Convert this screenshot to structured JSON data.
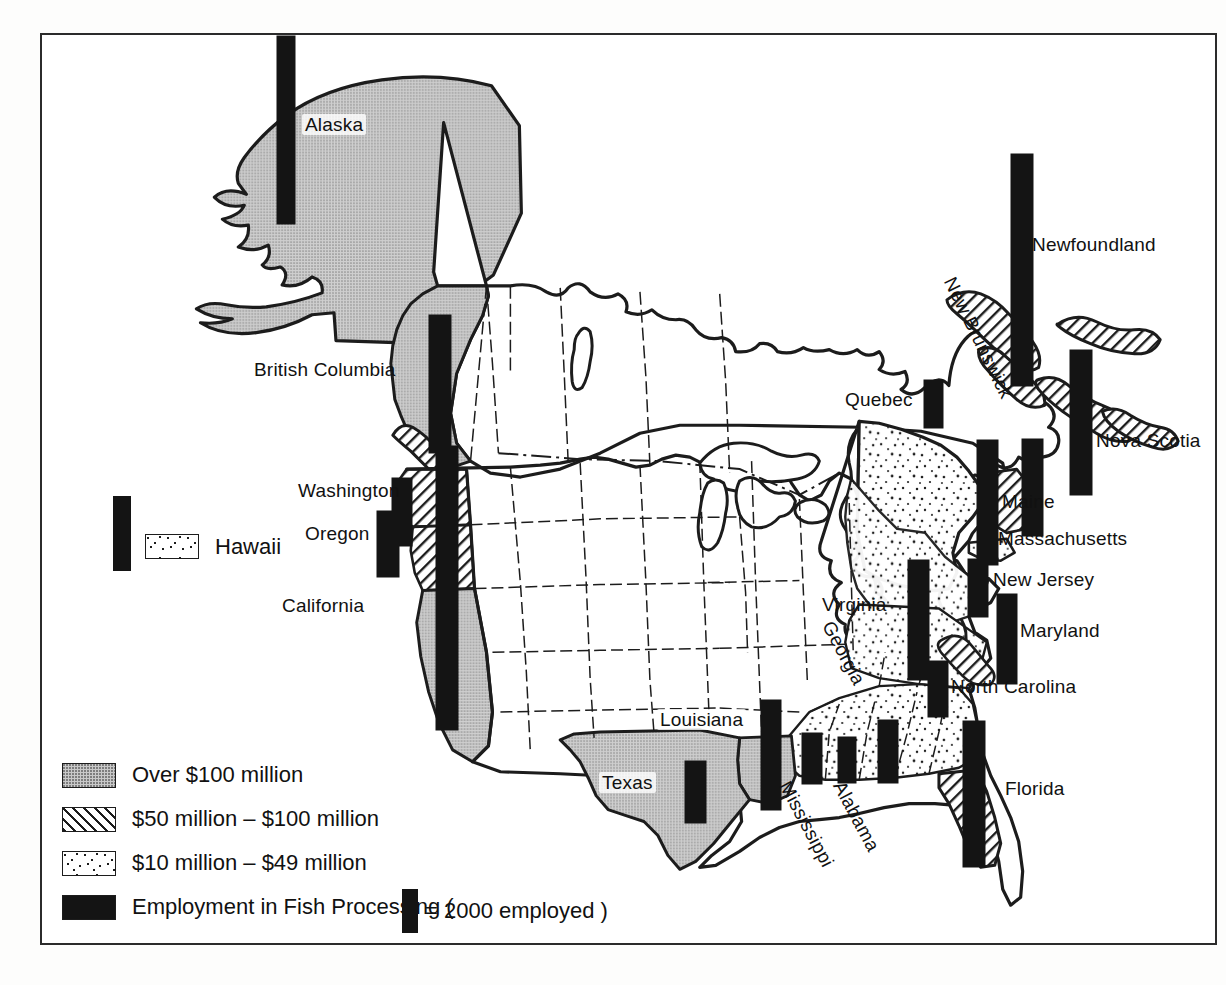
{
  "map": {
    "title": "Employment in Fish Processing — North America",
    "colors": {
      "ink": "#141414",
      "outline": "#1c1c1c",
      "over100_fill": "#c9c9c9",
      "paper": "#ffffff"
    },
    "region_labels": [
      {
        "name": "Alaska",
        "text": "Alaska",
        "x": 300,
        "y": 112,
        "rotate": 0,
        "boxed": true
      },
      {
        "name": "British Columbia",
        "text": "British Columbia",
        "x": 252,
        "y": 358,
        "rotate": 0,
        "boxed": false
      },
      {
        "name": "Washington",
        "text": "Washington",
        "x": 296,
        "y": 479,
        "rotate": 0,
        "boxed": false
      },
      {
        "name": "Oregon",
        "text": "Oregon",
        "x": 303,
        "y": 522,
        "rotate": 0,
        "boxed": false
      },
      {
        "name": "California",
        "text": "California",
        "x": 280,
        "y": 594,
        "rotate": 0,
        "boxed": false
      },
      {
        "name": "Texas",
        "text": "Texas",
        "x": 597,
        "y": 770,
        "rotate": 0,
        "boxed": true
      },
      {
        "name": "Louisiana",
        "text": "Louisiana",
        "x": 655,
        "y": 707,
        "rotate": 0,
        "boxed": true
      },
      {
        "name": "Mississippi",
        "text": "Mississippi",
        "x": 791,
        "y": 776,
        "rotate": 62,
        "boxed": false
      },
      {
        "name": "Alabama",
        "text": "Alabama",
        "x": 845,
        "y": 776,
        "rotate": 62,
        "boxed": false
      },
      {
        "name": "Georgia",
        "text": "Georgia",
        "x": 834,
        "y": 616,
        "rotate": 62,
        "boxed": false
      },
      {
        "name": "Florida",
        "text": "Florida",
        "x": 1003,
        "y": 777,
        "rotate": 0,
        "boxed": false
      },
      {
        "name": "Virginia",
        "text": "Virginia",
        "x": 820,
        "y": 593,
        "rotate": 0,
        "boxed": false
      },
      {
        "name": "North Carolina",
        "text": "North Carolina",
        "x": 949,
        "y": 675,
        "rotate": 0,
        "boxed": false
      },
      {
        "name": "Maryland",
        "text": "Maryland",
        "x": 1018,
        "y": 619,
        "rotate": 0,
        "boxed": false
      },
      {
        "name": "New Jersey",
        "text": "New Jersey",
        "x": 991,
        "y": 568,
        "rotate": 0,
        "boxed": false
      },
      {
        "name": "Massachusetts",
        "text": "Massachusetts",
        "x": 996,
        "y": 527,
        "rotate": 0,
        "boxed": false
      },
      {
        "name": "Maine",
        "text": "Maine",
        "x": 1000,
        "y": 490,
        "rotate": 0,
        "boxed": false
      },
      {
        "name": "Nova Scotia",
        "text": "Nova Scotia",
        "x": 1094,
        "y": 429,
        "rotate": 0,
        "boxed": false
      },
      {
        "name": "Newfoundland",
        "text": "Newfoundland",
        "x": 1030,
        "y": 233,
        "rotate": 0,
        "boxed": false
      },
      {
        "name": "New Brunswick",
        "text": "New Brunswick",
        "x": 956,
        "y": 272,
        "rotate": 64,
        "boxed": false
      },
      {
        "name": "Quebec",
        "text": "Quebec",
        "x": 843,
        "y": 388,
        "rotate": 0,
        "boxed": false
      }
    ],
    "employment_bars": [
      {
        "name": "alaska",
        "x": 275,
        "y": 34,
        "w": 18,
        "h": 188
      },
      {
        "name": "british-columbia",
        "x": 427,
        "y": 313,
        "w": 22,
        "h": 138
      },
      {
        "name": "washington",
        "x": 390,
        "y": 476,
        "w": 20,
        "h": 68
      },
      {
        "name": "oregon",
        "x": 375,
        "y": 509,
        "w": 22,
        "h": 66
      },
      {
        "name": "california",
        "x": 434,
        "y": 444,
        "w": 22,
        "h": 284
      },
      {
        "name": "texas",
        "x": 683,
        "y": 759,
        "w": 21,
        "h": 62
      },
      {
        "name": "louisiana",
        "x": 759,
        "y": 698,
        "w": 20,
        "h": 110
      },
      {
        "name": "mississippi",
        "x": 800,
        "y": 731,
        "w": 20,
        "h": 51
      },
      {
        "name": "alabama",
        "x": 836,
        "y": 735,
        "w": 18,
        "h": 46
      },
      {
        "name": "georgia",
        "x": 876,
        "y": 718,
        "w": 20,
        "h": 63
      },
      {
        "name": "florida",
        "x": 961,
        "y": 719,
        "w": 22,
        "h": 146
      },
      {
        "name": "north-carolina",
        "x": 926,
        "y": 659,
        "w": 20,
        "h": 56
      },
      {
        "name": "virginia",
        "x": 906,
        "y": 558,
        "w": 21,
        "h": 120
      },
      {
        "name": "maryland",
        "x": 995,
        "y": 592,
        "w": 20,
        "h": 90
      },
      {
        "name": "new-jersey",
        "x": 966,
        "y": 557,
        "w": 20,
        "h": 58
      },
      {
        "name": "massachusetts",
        "x": 975,
        "y": 438,
        "w": 21,
        "h": 125
      },
      {
        "name": "maine",
        "x": 1020,
        "y": 437,
        "w": 21,
        "h": 97
      },
      {
        "name": "nova-scotia",
        "x": 1068,
        "y": 348,
        "w": 22,
        "h": 145
      },
      {
        "name": "newfoundland",
        "x": 1009,
        "y": 152,
        "w": 22,
        "h": 232
      },
      {
        "name": "quebec",
        "x": 922,
        "y": 378,
        "w": 19,
        "h": 48
      }
    ]
  },
  "hawaii": {
    "label": "Hawaii"
  },
  "legend": {
    "items": [
      {
        "name": "over-100-million",
        "swatch": "over100",
        "label": "Over $100 million"
      },
      {
        "name": "50-to-100-million",
        "swatch": "50100",
        "label": "$50 million – $100 million"
      },
      {
        "name": "10-to-49-million",
        "swatch": "1049",
        "label": "$10 million – $49 million"
      }
    ],
    "employment": {
      "name": "employment-in-fish-processing",
      "label_before": "Employment in Fish Processing  (",
      "key_value": "= 2000 employed  )"
    }
  }
}
